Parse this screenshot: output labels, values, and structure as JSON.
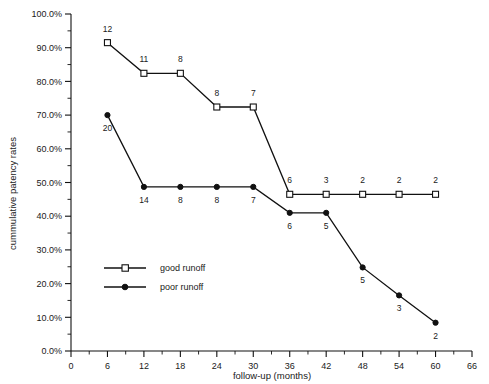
{
  "chart_data": {
    "type": "line",
    "title": "",
    "xlabel": "follow-up (months)",
    "ylabel": "cummulative patency rates",
    "xlim": [
      0,
      66
    ],
    "ylim": [
      0,
      1.0
    ],
    "grid": false,
    "legend_position": "inside-left",
    "xticks": [
      0,
      6,
      12,
      18,
      24,
      30,
      36,
      42,
      48,
      54,
      60,
      66
    ],
    "xtick_labels": [
      "0",
      "6",
      "12",
      "18",
      "24",
      "30",
      "36",
      "42",
      "48",
      "54",
      "60",
      "66"
    ],
    "x_minor_tick_step": 3,
    "yticks": [
      0,
      10,
      20,
      30,
      40,
      50,
      60,
      70,
      80,
      90,
      100
    ],
    "ytick_labels": [
      "0.0%",
      "10.0%",
      "20.0%",
      "30.0%",
      "40.0%",
      "50.0%",
      "60.0%",
      "70.0%",
      "80.0%",
      "90.0%",
      "100.0%"
    ],
    "y_minor_tick_step": 5,
    "series": [
      {
        "name": "good runoff",
        "marker": "open-square",
        "label_position": "above",
        "x": [
          6,
          12,
          18,
          24,
          30,
          36,
          42,
          48,
          54,
          60
        ],
        "values": [
          91.5,
          82.4,
          82.4,
          72.4,
          72.4,
          46.5,
          46.5,
          46.5,
          46.5,
          46.5
        ],
        "point_labels": [
          "12",
          "11",
          "8",
          "8",
          "7",
          "6",
          "3",
          "2",
          "2",
          "2"
        ]
      },
      {
        "name": "poor runoff",
        "marker": "filled-circle",
        "label_position": "below",
        "x": [
          6,
          12,
          18,
          24,
          30,
          36,
          42,
          48,
          54,
          60
        ],
        "values": [
          70.0,
          48.7,
          48.7,
          48.7,
          48.7,
          41.0,
          41.0,
          24.8,
          16.5,
          8.4
        ],
        "point_labels": [
          "20",
          "14",
          "8",
          "8",
          "7",
          "6",
          "5",
          "5",
          "3",
          "2"
        ]
      }
    ],
    "legend_entries": [
      {
        "label": "good runoff",
        "marker": "open-square"
      },
      {
        "label": "poor runoff",
        "marker": "filled-circle"
      }
    ],
    "colors": {
      "line": "#111111",
      "text": "#1a1a1a",
      "background": "#ffffff"
    }
  }
}
